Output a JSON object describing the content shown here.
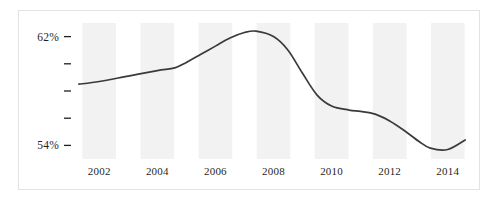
{
  "chart_data": {
    "type": "line",
    "title": "",
    "subtitle": "",
    "xlabel": "",
    "ylabel": "",
    "grid": false,
    "legend": "none",
    "banding": "alternating vertical bands centered on labeled even years",
    "band_color": "#f2f2f2",
    "line_color": "#3a3a3a",
    "border_color": "#e3e3e3",
    "xlim": [
      2001.2,
      2014.8
    ],
    "ylim": [
      53.0,
      63.0
    ],
    "y_axis": {
      "labeled_ticks": [
        "62%",
        "54%"
      ],
      "labeled_values": [
        62,
        54
      ],
      "unlabeled_tick_count": 3,
      "unlabeled_values": [
        60,
        58,
        56
      ],
      "all_tick_values": [
        62,
        60,
        58,
        56,
        54
      ],
      "unit": "percent"
    },
    "x_axis": {
      "tick_labels": [
        "2002",
        "2004",
        "2006",
        "2008",
        "2010",
        "2012",
        "2014"
      ],
      "tick_values": [
        2002,
        2004,
        2006,
        2008,
        2010,
        2012,
        2014
      ]
    },
    "series": [
      {
        "name": "rate",
        "x": [
          2001.3,
          2002.0,
          2003.0,
          2004.0,
          2004.6,
          2005.0,
          2005.5,
          2006.0,
          2006.5,
          2007.0,
          2007.4,
          2008.0,
          2008.5,
          2009.0,
          2009.5,
          2010.0,
          2010.6,
          2011.0,
          2011.5,
          2012.0,
          2012.5,
          2013.0,
          2013.4,
          2014.0,
          2014.6
        ],
        "values": [
          58.5,
          58.7,
          59.1,
          59.5,
          59.7,
          60.1,
          60.7,
          61.3,
          61.9,
          62.3,
          62.4,
          62.0,
          61.0,
          59.3,
          57.7,
          56.9,
          56.6,
          56.5,
          56.3,
          55.8,
          55.1,
          54.3,
          53.8,
          53.7,
          54.4
        ]
      }
    ],
    "annotations": []
  }
}
